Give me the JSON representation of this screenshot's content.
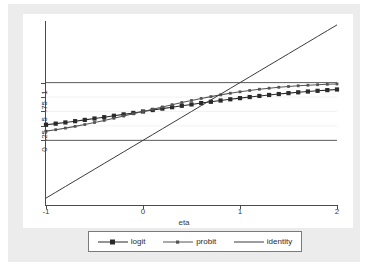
{
  "chart_data": {
    "type": "line",
    "title": "",
    "xlabel": "eta",
    "ylabel": "",
    "xlim": [
      -1,
      2
    ],
    "ylim": [
      -1.12,
      2.05
    ],
    "grid": true,
    "legend_position": "bottom",
    "xticks": [
      "-1",
      "0",
      "1",
      "2"
    ],
    "xtick_values": [
      -1,
      0,
      1,
      2
    ],
    "yticks": [
      "0",
      ".25",
      ".5",
      ".75",
      "1"
    ],
    "ytick_values": [
      0,
      0.25,
      0.5,
      0.75,
      1
    ],
    "reference_lines": [
      {
        "y": 0,
        "style": "solid-dark"
      },
      {
        "y": 1,
        "style": "solid-dark"
      },
      {
        "y": 0.25,
        "style": "faint-grid"
      },
      {
        "y": 0.5,
        "style": "faint-grid"
      },
      {
        "y": 0.75,
        "style": "faint-grid"
      }
    ],
    "x": [
      -1,
      -0.9,
      -0.8,
      -0.7,
      -0.6,
      -0.5,
      -0.4,
      -0.3,
      -0.2,
      -0.1,
      0,
      0.1,
      0.2,
      0.3,
      0.4,
      0.5,
      0.6,
      0.7,
      0.8,
      0.9,
      1,
      1.1,
      1.2,
      1.3,
      1.4,
      1.5,
      1.6,
      1.7,
      1.8,
      1.9,
      2
    ],
    "series": [
      {
        "name": "logit",
        "marker": "filled-square",
        "color": "#2a2a2a",
        "values": [
          0.269,
          0.289,
          0.31,
          0.332,
          0.354,
          0.378,
          0.401,
          0.426,
          0.45,
          0.475,
          0.5,
          0.525,
          0.55,
          0.574,
          0.599,
          0.622,
          0.646,
          0.668,
          0.69,
          0.711,
          0.731,
          0.75,
          0.769,
          0.786,
          0.802,
          0.818,
          0.832,
          0.846,
          0.858,
          0.87,
          0.881
        ]
      },
      {
        "name": "probit",
        "marker": "small-square",
        "color": "#555555",
        "values": [
          0.159,
          0.184,
          0.212,
          0.242,
          0.274,
          0.309,
          0.345,
          0.382,
          0.421,
          0.46,
          0.5,
          0.54,
          0.579,
          0.618,
          0.655,
          0.691,
          0.726,
          0.758,
          0.788,
          0.816,
          0.841,
          0.864,
          0.885,
          0.903,
          0.919,
          0.933,
          0.945,
          0.955,
          0.964,
          0.971,
          0.977
        ]
      },
      {
        "name": "identity",
        "marker": "none",
        "color": "#3a3a3a",
        "values": [
          -1,
          -0.9,
          -0.8,
          -0.7,
          -0.6,
          -0.5,
          -0.4,
          -0.3,
          -0.2,
          -0.1,
          0,
          0.1,
          0.2,
          0.3,
          0.4,
          0.5,
          0.6,
          0.7,
          0.8,
          0.9,
          1,
          1.1,
          1.2,
          1.3,
          1.4,
          1.5,
          1.6,
          1.7,
          1.8,
          1.9,
          2
        ]
      }
    ]
  },
  "legend": {
    "items": [
      {
        "label": "logit"
      },
      {
        "label": "probit"
      },
      {
        "label": "identity"
      }
    ]
  },
  "axes": {
    "x_title": "eta"
  },
  "colors": {
    "canvas": "#ececec",
    "plot_background": "#ffffff",
    "axis": "#4a4a4a",
    "grid_faint": "#f2f2f2",
    "reference": "#5a5a5a"
  }
}
